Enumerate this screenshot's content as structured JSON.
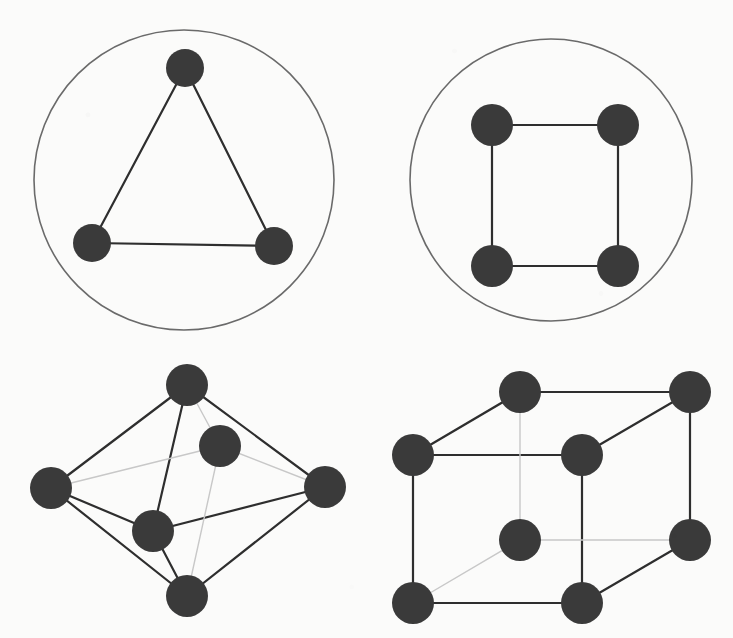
{
  "page": {
    "width": 733,
    "height": 638,
    "background_color": "#fbfbfa"
  },
  "style": {
    "node_fill": "#3a3a3a",
    "edge_color": "#2e2e2e",
    "circle_stroke": "#6a6a6a",
    "hidden_edge_color": "#c8c8c8",
    "edge_width": 2.2,
    "circle_width": 1.6,
    "hidden_edge_width": 1.4
  },
  "figures": [
    {
      "id": "figure-triangle-in-circle",
      "name": "triangle-in-circle",
      "label": "Triangle inscribed in a circle",
      "position": "top-left",
      "shape_type": "cyclic-polygon",
      "node_count": 3,
      "edge_count": 3,
      "node_radius": 19,
      "circle": {
        "cx": 184,
        "cy": 180,
        "r": 150
      },
      "nodes": [
        {
          "id": "t0",
          "label": "apex",
          "x": 185,
          "y": 68
        },
        {
          "id": "t1",
          "label": "lower-left",
          "x": 92,
          "y": 243
        },
        {
          "id": "t2",
          "label": "lower-right",
          "x": 274,
          "y": 246
        }
      ],
      "edges": [
        {
          "from": 0,
          "to": 1,
          "hidden": false
        },
        {
          "from": 0,
          "to": 2,
          "hidden": false
        },
        {
          "from": 1,
          "to": 2,
          "hidden": false
        }
      ]
    },
    {
      "id": "figure-square-in-circle",
      "name": "square-in-circle",
      "label": "Square inscribed in a circle",
      "position": "top-right",
      "shape_type": "cyclic-polygon",
      "node_count": 4,
      "edge_count": 4,
      "node_radius": 21,
      "circle": {
        "cx": 551,
        "cy": 180,
        "r": 141
      },
      "nodes": [
        {
          "id": "s0",
          "label": "top-left",
          "x": 492,
          "y": 125
        },
        {
          "id": "s1",
          "label": "top-right",
          "x": 618,
          "y": 125
        },
        {
          "id": "s2",
          "label": "bottom-right",
          "x": 618,
          "y": 266
        },
        {
          "id": "s3",
          "label": "bottom-left",
          "x": 492,
          "y": 266
        }
      ],
      "edges": [
        {
          "from": 0,
          "to": 1,
          "hidden": false
        },
        {
          "from": 1,
          "to": 2,
          "hidden": false
        },
        {
          "from": 2,
          "to": 3,
          "hidden": false
        },
        {
          "from": 3,
          "to": 0,
          "hidden": false
        }
      ]
    },
    {
      "id": "figure-octahedron",
      "name": "octahedron",
      "label": "Octahedron wireframe graph",
      "position": "bottom-left",
      "shape_type": "polyhedron-wireframe",
      "node_count": 6,
      "edge_count": 12,
      "node_radius": 21,
      "circle": null,
      "nodes": [
        {
          "id": "o0",
          "label": "top",
          "x": 187,
          "y": 385
        },
        {
          "id": "o1",
          "label": "left",
          "x": 51,
          "y": 488
        },
        {
          "id": "o2",
          "label": "front",
          "x": 153,
          "y": 531
        },
        {
          "id": "o3",
          "label": "back",
          "x": 220,
          "y": 446
        },
        {
          "id": "o4",
          "label": "right",
          "x": 325,
          "y": 487
        },
        {
          "id": "o5",
          "label": "bottom",
          "x": 187,
          "y": 596
        }
      ],
      "edges": [
        {
          "from": 0,
          "to": 1,
          "hidden": false
        },
        {
          "from": 0,
          "to": 2,
          "hidden": false
        },
        {
          "from": 0,
          "to": 3,
          "hidden": true
        },
        {
          "from": 0,
          "to": 4,
          "hidden": false
        },
        {
          "from": 1,
          "to": 2,
          "hidden": false
        },
        {
          "from": 1,
          "to": 3,
          "hidden": true
        },
        {
          "from": 1,
          "to": 5,
          "hidden": false
        },
        {
          "from": 2,
          "to": 4,
          "hidden": false
        },
        {
          "from": 2,
          "to": 5,
          "hidden": false
        },
        {
          "from": 3,
          "to": 4,
          "hidden": true
        },
        {
          "from": 3,
          "to": 5,
          "hidden": true
        },
        {
          "from": 4,
          "to": 5,
          "hidden": false
        }
      ]
    },
    {
      "id": "figure-cube",
      "name": "cube",
      "label": "Cube wireframe graph",
      "position": "bottom-right",
      "shape_type": "polyhedron-wireframe",
      "node_count": 8,
      "edge_count": 12,
      "node_radius": 21,
      "circle": null,
      "nodes": [
        {
          "id": "c0",
          "label": "front-top-left",
          "x": 413,
          "y": 455
        },
        {
          "id": "c1",
          "label": "front-top-right",
          "x": 582,
          "y": 455
        },
        {
          "id": "c2",
          "label": "front-bottom-right",
          "x": 582,
          "y": 603
        },
        {
          "id": "c3",
          "label": "front-bottom-left",
          "x": 413,
          "y": 603
        },
        {
          "id": "c4",
          "label": "back-top-left",
          "x": 520,
          "y": 392
        },
        {
          "id": "c5",
          "label": "back-top-right",
          "x": 690,
          "y": 392
        },
        {
          "id": "c6",
          "label": "back-bottom-right",
          "x": 690,
          "y": 540
        },
        {
          "id": "c7",
          "label": "back-bottom-left",
          "x": 520,
          "y": 540
        }
      ],
      "edges": [
        {
          "from": 0,
          "to": 1,
          "hidden": false
        },
        {
          "from": 1,
          "to": 2,
          "hidden": false
        },
        {
          "from": 2,
          "to": 3,
          "hidden": false
        },
        {
          "from": 3,
          "to": 0,
          "hidden": false
        },
        {
          "from": 4,
          "to": 5,
          "hidden": false
        },
        {
          "from": 5,
          "to": 6,
          "hidden": false
        },
        {
          "from": 6,
          "to": 7,
          "hidden": true
        },
        {
          "from": 7,
          "to": 4,
          "hidden": true
        },
        {
          "from": 0,
          "to": 4,
          "hidden": false
        },
        {
          "from": 1,
          "to": 5,
          "hidden": false
        },
        {
          "from": 2,
          "to": 6,
          "hidden": false
        },
        {
          "from": 3,
          "to": 7,
          "hidden": true
        }
      ]
    }
  ]
}
